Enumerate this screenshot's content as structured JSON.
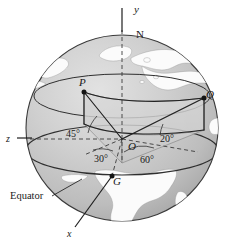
{
  "figure": {
    "name": "earth-sphere-spherical-coordinates-diagram",
    "caption_labels": {
      "equator": "Equator"
    },
    "axes": [
      {
        "id": "y-axis",
        "label": "y",
        "style": "italic",
        "x": 134,
        "y": 13
      },
      {
        "id": "z-axis",
        "label": "z",
        "style": "italic",
        "x": 9,
        "y": 137
      },
      {
        "id": "x-axis",
        "label": "x",
        "style": "italic",
        "x": 70,
        "y": 236
      }
    ],
    "points": [
      {
        "id": "point-N",
        "label": "N",
        "style": "upright",
        "x": 140,
        "y": 37
      },
      {
        "id": "point-P",
        "label": "P",
        "style": "italic",
        "x": 78,
        "y": 86
      },
      {
        "id": "point-Q",
        "label": "Q",
        "style": "italic",
        "x": 208,
        "y": 104
      },
      {
        "id": "point-O",
        "label": "O",
        "style": "italic",
        "x": 132,
        "y": 147
      },
      {
        "id": "point-G",
        "label": "G",
        "style": "italic",
        "x": 116,
        "y": 182
      }
    ],
    "angles": [
      {
        "id": "angle-45",
        "label": "45°",
        "x": 74,
        "y": 134
      },
      {
        "id": "angle-20",
        "label": "20°",
        "x": 166,
        "y": 139
      },
      {
        "id": "angle-30",
        "label": "30°",
        "x": 103,
        "y": 159
      },
      {
        "id": "angle-60",
        "label": "60°",
        "x": 149,
        "y": 160
      }
    ],
    "colors": {
      "sphere_light": "#d2d2d2",
      "sphere_mid": "#bfbfbf",
      "sphere_dark": "#a9a9a9",
      "land": "#fbfbfb",
      "line": "#2a2a2a",
      "text": "#141414",
      "background": "#ffffff"
    }
  }
}
